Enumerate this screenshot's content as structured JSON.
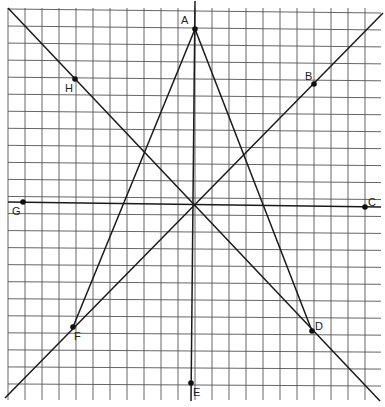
{
  "figure": {
    "type": "geometry-grid-diagram",
    "grid": {
      "left": 8,
      "top": 10,
      "right": 381,
      "bottom": 400,
      "spacing": 17
    },
    "colors": {
      "background": "#ffffff",
      "grid": "#555555",
      "lines": "#1a1a1a",
      "points": "#111111"
    },
    "points": [
      {
        "id": "A",
        "label": "A",
        "x": 195,
        "y": 29,
        "lx": 181,
        "ly": 24
      },
      {
        "id": "B",
        "label": "B",
        "x": 314,
        "y": 84,
        "lx": 305,
        "ly": 80
      },
      {
        "id": "C",
        "label": "C",
        "x": 365,
        "y": 207,
        "lx": 368,
        "ly": 206
      },
      {
        "id": "D",
        "label": "D",
        "x": 312,
        "y": 331,
        "lx": 315,
        "ly": 330
      },
      {
        "id": "E",
        "label": "E",
        "x": 191,
        "y": 383,
        "lx": 193,
        "ly": 396
      },
      {
        "id": "F",
        "label": "F",
        "x": 73,
        "y": 327,
        "lx": 74,
        "ly": 340
      },
      {
        "id": "G",
        "label": "G",
        "x": 23,
        "y": 202,
        "lx": 12,
        "ly": 215
      },
      {
        "id": "H",
        "label": "H",
        "x": 75,
        "y": 79,
        "lx": 65,
        "ly": 92
      }
    ],
    "lines": [
      {
        "name": "vertical-axis-A-E",
        "x1": 195,
        "y1": 1,
        "x2": 191,
        "y2": 401
      },
      {
        "name": "horizontal-axis-G-C",
        "x1": 8,
        "y1": 202,
        "x2": 381,
        "y2": 207
      },
      {
        "name": "diagonal-H-D",
        "x1": 8,
        "y1": 8,
        "x2": 380,
        "y2": 401
      },
      {
        "name": "diagonal-F-B",
        "x1": 5,
        "y1": 398,
        "x2": 383,
        "y2": 13
      },
      {
        "name": "triangle-side-A-F",
        "x1": 195,
        "y1": 29,
        "x2": 73,
        "y2": 327
      },
      {
        "name": "triangle-side-A-D",
        "x1": 195,
        "y1": 29,
        "x2": 312,
        "y2": 331
      },
      {
        "name": "triangle-side-F-D",
        "x1": 73,
        "y1": 327,
        "x2": 312,
        "y2": 331,
        "hidden": true
      }
    ]
  }
}
